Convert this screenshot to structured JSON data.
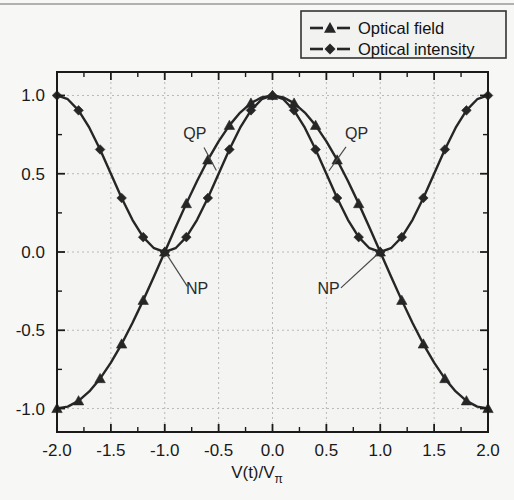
{
  "figure": {
    "background_color": "#f7f7f5",
    "frame_color": "#1a1a1a",
    "grid_color": "#b9b9b9",
    "series_color": "#262626"
  },
  "legend": {
    "position": "top-right",
    "entries": [
      {
        "label": "Optical field",
        "marker": "triangle-up",
        "color": "#262626"
      },
      {
        "label": "Optical intensity",
        "marker": "diamond",
        "color": "#262626"
      }
    ]
  },
  "annotations": [
    {
      "text": "QP",
      "x_data": -0.72,
      "y_data": 0.72,
      "point_x": -0.5,
      "point_y": 0.5
    },
    {
      "text": "QP",
      "x_data": 0.78,
      "y_data": 0.72,
      "point_x": 0.5,
      "point_y": 0.5
    },
    {
      "text": "NP",
      "x_data": -0.7,
      "y_data": -0.27,
      "point_x": -1.0,
      "point_y": 0.0
    },
    {
      "text": "NP",
      "x_data": 0.52,
      "y_data": -0.27,
      "point_x": 1.0,
      "point_y": 0.0
    }
  ],
  "chart_data": {
    "type": "line",
    "title": "",
    "xlabel": "V(t)/V",
    "xlabel_sub": "π",
    "ylabel": "",
    "xlim": [
      -2.0,
      2.0
    ],
    "ylim": [
      -1.15,
      1.15
    ],
    "grid": true,
    "xticks": [
      -2.0,
      -1.5,
      -1.0,
      -0.5,
      0.0,
      0.5,
      1.0,
      1.5,
      2.0
    ],
    "xticklabels": [
      "-2.0",
      "-1.5",
      "-1.0",
      "-0.5",
      "0.0",
      "0.5",
      "1.0",
      "1.5",
      "2.0"
    ],
    "yticks": [
      -1.0,
      -0.5,
      0.0,
      0.5,
      1.0
    ],
    "yticklabels": [
      "-1.0",
      "-0.5",
      "0.0",
      "0.5",
      "1.0"
    ],
    "xminor_step": 0.25,
    "yminor_step": 0.25,
    "series": [
      {
        "name": "Optical field",
        "marker": "triangle-up",
        "formula": "cos(pi*x/2)",
        "x": [
          -2.0,
          -1.9,
          -1.8,
          -1.7,
          -1.6,
          -1.5,
          -1.4,
          -1.3,
          -1.2,
          -1.1,
          -1.0,
          -0.9,
          -0.8,
          -0.7,
          -0.6,
          -0.5,
          -0.4,
          -0.3,
          -0.2,
          -0.1,
          0.0,
          0.1,
          0.2,
          0.3,
          0.4,
          0.5,
          0.6,
          0.7,
          0.8,
          0.9,
          1.0,
          1.1,
          1.2,
          1.3,
          1.4,
          1.5,
          1.6,
          1.7,
          1.8,
          1.9,
          2.0
        ],
        "y": [
          -1.0,
          -0.988,
          -0.951,
          -0.891,
          -0.809,
          -0.707,
          -0.588,
          -0.454,
          -0.309,
          -0.156,
          0.0,
          0.156,
          0.309,
          0.454,
          0.588,
          0.707,
          0.809,
          0.891,
          0.951,
          0.988,
          1.0,
          0.988,
          0.951,
          0.891,
          0.809,
          0.707,
          0.588,
          0.454,
          0.309,
          0.156,
          0.0,
          -0.156,
          -0.309,
          -0.454,
          -0.588,
          -0.707,
          -0.809,
          -0.891,
          -0.951,
          -0.988,
          -1.0
        ]
      },
      {
        "name": "Optical intensity",
        "marker": "diamond",
        "formula": "cos^2(pi*x/2)",
        "x": [
          -2.0,
          -1.9,
          -1.8,
          -1.7,
          -1.6,
          -1.5,
          -1.4,
          -1.3,
          -1.2,
          -1.1,
          -1.0,
          -0.9,
          -0.8,
          -0.7,
          -0.6,
          -0.5,
          -0.4,
          -0.3,
          -0.2,
          -0.1,
          0.0,
          0.1,
          0.2,
          0.3,
          0.4,
          0.5,
          0.6,
          0.7,
          0.8,
          0.9,
          1.0,
          1.1,
          1.2,
          1.3,
          1.4,
          1.5,
          1.6,
          1.7,
          1.8,
          1.9,
          2.0
        ],
        "y": [
          1.0,
          0.976,
          0.905,
          0.794,
          0.655,
          0.5,
          0.345,
          0.206,
          0.095,
          0.024,
          0.0,
          0.024,
          0.095,
          0.206,
          0.345,
          0.5,
          0.655,
          0.794,
          0.905,
          0.976,
          1.0,
          0.976,
          0.905,
          0.794,
          0.655,
          0.5,
          0.345,
          0.206,
          0.095,
          0.024,
          0.0,
          0.024,
          0.095,
          0.206,
          0.345,
          0.5,
          0.655,
          0.794,
          0.905,
          0.976,
          1.0
        ]
      }
    ]
  }
}
